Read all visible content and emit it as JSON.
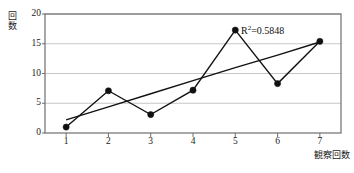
{
  "chart_data": {
    "type": "line",
    "title": "",
    "subtitle": "",
    "xlabel": "観察回数",
    "ylabel": "回数",
    "ylabel_chars": [
      "回",
      "数"
    ],
    "categories": [
      "1",
      "2",
      "3",
      "4",
      "5",
      "6",
      "7"
    ],
    "x": [
      1,
      2,
      3,
      4,
      5,
      6,
      7
    ],
    "series": [
      {
        "name": "回数",
        "type": "line-with-markers",
        "values": [
          1.0,
          7.1,
          3.1,
          7.2,
          17.3,
          8.3,
          15.4
        ],
        "color": "#111111",
        "marker": "filled-circle"
      },
      {
        "name": "trendline",
        "type": "linear-trendline",
        "values": [
          2.2,
          4.4,
          6.6,
          8.8,
          11.0,
          13.1,
          15.3
        ],
        "color": "#111111",
        "marker": "none"
      }
    ],
    "ylim": [
      0,
      20
    ],
    "yticks": [
      0,
      5,
      10,
      15,
      20
    ],
    "ytick_labels": [
      "0",
      "5",
      "10",
      "15",
      "20"
    ],
    "xtick_labels": [
      "1",
      "2",
      "3",
      "4",
      "5",
      "6",
      "7"
    ],
    "grid": "horizontal",
    "grid_color": "#b9b9b9",
    "axis_color": "#6e6e6e",
    "legend": "none",
    "annotations": [
      {
        "name": "r-squared",
        "text_prefix": "R",
        "text_superscript": "2",
        "text_suffix": "=0.5848",
        "full_text": "R2=0.5848",
        "value": 0.5848,
        "x_px": 241,
        "y_px": 25
      }
    ],
    "plot_area": {
      "left": 45,
      "top": 14,
      "right": 341,
      "bottom": 133
    }
  }
}
